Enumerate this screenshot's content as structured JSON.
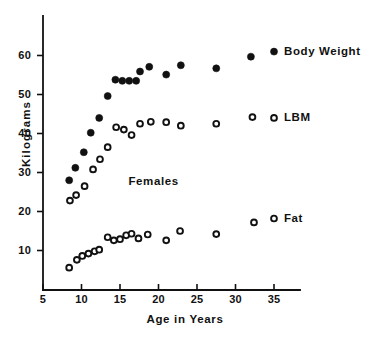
{
  "chart_data": {
    "type": "scatter",
    "title": "",
    "xlabel": "Age in Years",
    "ylabel": "Kilograms",
    "xlim": [
      5,
      36.5
    ],
    "ylim": [
      0,
      68
    ],
    "xticks": [
      5,
      10,
      15,
      20,
      25,
      30,
      35
    ],
    "xtick_labels": [
      "5",
      "10",
      "15",
      "20",
      "25",
      "30",
      "35"
    ],
    "yticks": [
      10,
      20,
      30,
      40,
      50,
      60
    ],
    "ytick_labels": [
      "10",
      "20",
      "30",
      "40",
      "50",
      "60"
    ],
    "grid": false,
    "legend": "inline-right",
    "annotations": [
      {
        "text": "Females",
        "x": 20.0,
        "y": 27.5
      }
    ],
    "series": [
      {
        "name": "Body Weight",
        "marker": "filled-circle",
        "color": "#111111",
        "label_x": 35.0,
        "label_y": 61.0,
        "points": [
          {
            "x": 8.4,
            "y": 28.0
          },
          {
            "x": 9.2,
            "y": 31.2
          },
          {
            "x": 10.3,
            "y": 35.2
          },
          {
            "x": 11.2,
            "y": 40.2
          },
          {
            "x": 12.3,
            "y": 44.0
          },
          {
            "x": 13.4,
            "y": 49.6
          },
          {
            "x": 14.4,
            "y": 53.8
          },
          {
            "x": 15.3,
            "y": 53.5
          },
          {
            "x": 16.2,
            "y": 53.5
          },
          {
            "x": 17.1,
            "y": 53.5
          },
          {
            "x": 17.6,
            "y": 55.9
          },
          {
            "x": 18.8,
            "y": 57.1
          },
          {
            "x": 21.0,
            "y": 55.1
          },
          {
            "x": 22.9,
            "y": 57.5
          },
          {
            "x": 27.5,
            "y": 56.7
          },
          {
            "x": 32.0,
            "y": 59.7
          }
        ]
      },
      {
        "name": "LBM",
        "marker": "open-circle",
        "color": "#111111",
        "label_x": 35.0,
        "label_y": 44.0,
        "points": [
          {
            "x": 8.5,
            "y": 22.8
          },
          {
            "x": 9.3,
            "y": 24.2
          },
          {
            "x": 10.4,
            "y": 26.5
          },
          {
            "x": 11.5,
            "y": 30.8
          },
          {
            "x": 12.4,
            "y": 33.4
          },
          {
            "x": 13.4,
            "y": 36.5
          },
          {
            "x": 14.5,
            "y": 41.6
          },
          {
            "x": 15.5,
            "y": 41.0
          },
          {
            "x": 16.5,
            "y": 39.6
          },
          {
            "x": 17.6,
            "y": 42.5
          },
          {
            "x": 19.0,
            "y": 43.0
          },
          {
            "x": 21.0,
            "y": 42.9
          },
          {
            "x": 22.9,
            "y": 42.0
          },
          {
            "x": 27.5,
            "y": 42.5
          },
          {
            "x": 32.2,
            "y": 44.2
          }
        ]
      },
      {
        "name": "Fat",
        "marker": "open-circle",
        "color": "#111111",
        "label_x": 35.0,
        "label_y": 18.2,
        "points": [
          {
            "x": 8.4,
            "y": 5.6
          },
          {
            "x": 9.4,
            "y": 7.6
          },
          {
            "x": 10.1,
            "y": 8.6
          },
          {
            "x": 10.9,
            "y": 9.2
          },
          {
            "x": 11.7,
            "y": 9.8
          },
          {
            "x": 12.3,
            "y": 10.2
          },
          {
            "x": 13.4,
            "y": 13.4
          },
          {
            "x": 14.2,
            "y": 12.6
          },
          {
            "x": 15.0,
            "y": 12.9
          },
          {
            "x": 15.8,
            "y": 13.9
          },
          {
            "x": 16.5,
            "y": 14.3
          },
          {
            "x": 17.4,
            "y": 13.1
          },
          {
            "x": 18.6,
            "y": 14.1
          },
          {
            "x": 21.0,
            "y": 12.6
          },
          {
            "x": 22.8,
            "y": 15.0
          },
          {
            "x": 27.5,
            "y": 14.2
          },
          {
            "x": 32.4,
            "y": 17.2
          }
        ]
      }
    ]
  }
}
